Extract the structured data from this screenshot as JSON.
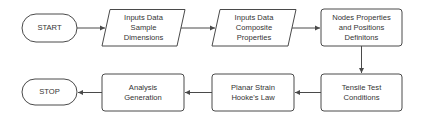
{
  "colors": {
    "stroke": "#4a4a4a",
    "text": "#333333",
    "background": "#ffffff"
  },
  "nodes": {
    "start": {
      "label": "START",
      "shape": "terminator"
    },
    "inputs_sample": {
      "label": "Inputs Data\nSample\nDimensions",
      "shape": "parallelogram"
    },
    "inputs_composite": {
      "label": "Inputs Data\nComposite\nProperties",
      "shape": "parallelogram"
    },
    "nodes_props": {
      "label": "Nodes Properties\nand Positions\nDefinitons",
      "shape": "process"
    },
    "tensile": {
      "label": "Tensile Test\nConditions",
      "shape": "process"
    },
    "planar": {
      "label": "Planar Strain\nHooke's Law",
      "shape": "process"
    },
    "analysis": {
      "label": "Analysis\nGeneration",
      "shape": "process"
    },
    "stop": {
      "label": "STOP",
      "shape": "terminator"
    }
  },
  "edges": [
    {
      "from": "start",
      "to": "inputs_sample"
    },
    {
      "from": "inputs_sample",
      "to": "inputs_composite"
    },
    {
      "from": "inputs_composite",
      "to": "nodes_props"
    },
    {
      "from": "nodes_props",
      "to": "tensile"
    },
    {
      "from": "tensile",
      "to": "planar"
    },
    {
      "from": "planar",
      "to": "analysis"
    },
    {
      "from": "analysis",
      "to": "stop"
    }
  ]
}
